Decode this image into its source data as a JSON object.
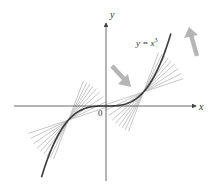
{
  "diagram": {
    "curve_label": "y = x",
    "curve_exponent": "3",
    "x_axis_label": "x",
    "y_axis_label": "y",
    "origin_label": "0",
    "colors": {
      "curve": "#3a3a3a",
      "axes": "#444444",
      "secant_lines": "#b8b8b8",
      "arrows": "#b5b5b5",
      "background": "#ffffff"
    },
    "points_of_tangency": [
      {
        "x": 1,
        "y": 1
      },
      {
        "x": -1,
        "y": -1
      }
    ],
    "secant_slopes_right": [
      0.9,
      1.3,
      1.8,
      2.4,
      3.0,
      3.7,
      4.5,
      5.5,
      7.0
    ],
    "secant_slopes_left": [
      0.9,
      1.3,
      1.8,
      2.4,
      3.0,
      3.7,
      4.5,
      5.5,
      7.0
    ],
    "arrows": [
      {
        "name": "down-right-arrow",
        "from": [
          112,
          66
        ],
        "to": [
          128,
          84
        ]
      },
      {
        "name": "up-arrow",
        "from": [
          196,
          56
        ],
        "to": [
          190,
          29
        ]
      }
    ]
  }
}
